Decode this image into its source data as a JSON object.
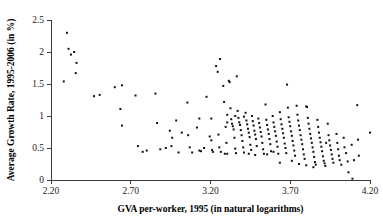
{
  "chart_data": {
    "type": "scatter",
    "title": "",
    "xlabel": "GVA per-worker, 1995 (in natural logarithms)",
    "ylabel": "Average Growth Rate, 1995-2006 (in %)",
    "xlim": [
      2.2,
      4.2
    ],
    "ylim": [
      0,
      2.5
    ],
    "xticks": [
      2.2,
      2.7,
      3.2,
      3.7,
      4.2
    ],
    "xtick_labels": [
      "2.20",
      "2.70",
      "3.20",
      "3.70",
      "4.20"
    ],
    "yticks": [
      0,
      0.5,
      1,
      1.5,
      2,
      2.5
    ],
    "ytick_labels": [
      "0",
      "0.5",
      "1",
      "1.5",
      "2",
      "2.5"
    ],
    "grid": false,
    "legend": null,
    "marker": "square",
    "marker_color": "#111111",
    "marker_size": 2,
    "series": [
      {
        "name": "regions",
        "points": [
          [
            2.3,
            2.3
          ],
          [
            2.28,
            1.54
          ],
          [
            2.31,
            2.05
          ],
          [
            2.325,
            1.96
          ],
          [
            2.345,
            2.0
          ],
          [
            2.36,
            1.83
          ],
          [
            2.355,
            1.67
          ],
          [
            2.47,
            1.31
          ],
          [
            2.505,
            1.33
          ],
          [
            2.6,
            1.45
          ],
          [
            2.645,
            1.48
          ],
          [
            2.635,
            1.11
          ],
          [
            2.645,
            0.85
          ],
          [
            2.73,
            1.32
          ],
          [
            2.745,
            0.53
          ],
          [
            2.775,
            0.44
          ],
          [
            2.8,
            0.46
          ],
          [
            2.855,
            1.35
          ],
          [
            2.865,
            0.89
          ],
          [
            2.885,
            0.48
          ],
          [
            2.945,
            0.77
          ],
          [
            2.955,
            0.53
          ],
          [
            2.96,
            0.66
          ],
          [
            2.985,
            0.93
          ],
          [
            3.0,
            0.43
          ],
          [
            3.02,
            0.74
          ],
          [
            3.055,
            1.21
          ],
          [
            3.06,
            0.7
          ],
          [
            3.085,
            0.43
          ],
          [
            3.115,
            0.82
          ],
          [
            3.13,
            0.46
          ],
          [
            3.14,
            0.45
          ],
          [
            3.175,
            1.3
          ],
          [
            3.195,
            0.68
          ],
          [
            3.205,
            0.62
          ],
          [
            3.21,
            0.47
          ],
          [
            3.215,
            0.44
          ],
          [
            3.235,
            1.78
          ],
          [
            3.245,
            1.69
          ],
          [
            3.26,
            1.89
          ],
          [
            3.25,
            0.71
          ],
          [
            3.255,
            0.51
          ],
          [
            3.265,
            0.44
          ],
          [
            3.28,
            1.47
          ],
          [
            3.285,
            1.22
          ],
          [
            3.295,
            0.83
          ],
          [
            3.3,
            0.58
          ],
          [
            3.305,
            0.41
          ],
          [
            3.315,
            1.55
          ],
          [
            3.32,
            1.53
          ],
          [
            3.325,
            1.12
          ],
          [
            3.33,
            0.95
          ],
          [
            3.335,
            0.88
          ],
          [
            3.34,
            0.84
          ],
          [
            3.345,
            0.79
          ],
          [
            3.35,
            0.66
          ],
          [
            3.355,
            0.49
          ],
          [
            3.36,
            0.42
          ],
          [
            3.365,
            1.62
          ],
          [
            3.37,
            1.08
          ],
          [
            3.375,
            0.97
          ],
          [
            3.38,
            0.9
          ],
          [
            3.385,
            0.86
          ],
          [
            3.39,
            0.78
          ],
          [
            3.395,
            0.7
          ],
          [
            3.4,
            0.61
          ],
          [
            3.405,
            0.51
          ],
          [
            3.41,
            0.43
          ],
          [
            3.42,
            1.05
          ],
          [
            3.425,
            0.93
          ],
          [
            3.43,
            0.87
          ],
          [
            3.435,
            0.8
          ],
          [
            3.44,
            0.74
          ],
          [
            3.445,
            0.67
          ],
          [
            3.45,
            0.55
          ],
          [
            3.455,
            0.47
          ],
          [
            3.46,
            1.0
          ],
          [
            3.465,
            0.92
          ],
          [
            3.47,
            0.85
          ],
          [
            3.475,
            0.77
          ],
          [
            3.48,
            0.71
          ],
          [
            3.485,
            0.64
          ],
          [
            3.49,
            0.53
          ],
          [
            3.5,
            0.96
          ],
          [
            3.505,
            0.89
          ],
          [
            3.51,
            0.82
          ],
          [
            3.515,
            0.75
          ],
          [
            3.52,
            0.68
          ],
          [
            3.525,
            0.58
          ],
          [
            3.53,
            0.48
          ],
          [
            3.535,
            0.41
          ],
          [
            3.545,
            1.18
          ],
          [
            3.55,
            0.94
          ],
          [
            3.555,
            0.86
          ],
          [
            3.56,
            0.79
          ],
          [
            3.565,
            0.72
          ],
          [
            3.57,
            0.64
          ],
          [
            3.575,
            0.56
          ],
          [
            3.58,
            0.45
          ],
          [
            3.59,
            1.0
          ],
          [
            3.595,
            0.9
          ],
          [
            3.6,
            0.83
          ],
          [
            3.605,
            0.76
          ],
          [
            3.61,
            0.69
          ],
          [
            3.615,
            0.6
          ],
          [
            3.62,
            0.52
          ],
          [
            3.625,
            0.41
          ],
          [
            3.635,
            1.06
          ],
          [
            3.64,
            0.95
          ],
          [
            3.645,
            0.87
          ],
          [
            3.65,
            0.8
          ],
          [
            3.655,
            0.73
          ],
          [
            3.66,
            0.66
          ],
          [
            3.665,
            0.57
          ],
          [
            3.67,
            0.5
          ],
          [
            3.675,
            0.42
          ],
          [
            3.68,
            1.49
          ],
          [
            3.685,
            1.13
          ],
          [
            3.69,
            0.98
          ],
          [
            3.695,
            0.91
          ],
          [
            3.7,
            0.84
          ],
          [
            3.705,
            0.76
          ],
          [
            3.71,
            0.69
          ],
          [
            3.715,
            0.61
          ],
          [
            3.72,
            0.54
          ],
          [
            3.725,
            0.46
          ],
          [
            3.73,
            0.38
          ],
          [
            3.74,
            1.16
          ],
          [
            3.745,
            1.02
          ],
          [
            3.75,
            0.93
          ],
          [
            3.755,
            0.85
          ],
          [
            3.76,
            0.78
          ],
          [
            3.765,
            0.7
          ],
          [
            3.77,
            0.63
          ],
          [
            3.775,
            0.56
          ],
          [
            3.78,
            0.48
          ],
          [
            3.785,
            0.4
          ],
          [
            3.79,
            0.33
          ],
          [
            3.8,
            1.15
          ],
          [
            3.805,
            1.14
          ],
          [
            3.81,
            0.97
          ],
          [
            3.815,
            0.88
          ],
          [
            3.82,
            0.8
          ],
          [
            3.825,
            0.72
          ],
          [
            3.83,
            0.65
          ],
          [
            3.835,
            0.58
          ],
          [
            3.84,
            0.51
          ],
          [
            3.845,
            0.44
          ],
          [
            3.85,
            0.36
          ],
          [
            3.855,
            0.28
          ],
          [
            3.86,
            0.24
          ],
          [
            3.87,
            0.94
          ],
          [
            3.875,
            0.83
          ],
          [
            3.88,
            0.74
          ],
          [
            3.885,
            0.66
          ],
          [
            3.89,
            0.59
          ],
          [
            3.895,
            0.52
          ],
          [
            3.9,
            0.45
          ],
          [
            3.905,
            0.37
          ],
          [
            3.91,
            0.3
          ],
          [
            3.915,
            0.26
          ],
          [
            3.92,
            0.22
          ],
          [
            3.935,
            0.88
          ],
          [
            3.94,
            0.7
          ],
          [
            3.945,
            0.62
          ],
          [
            3.95,
            0.54
          ],
          [
            3.955,
            0.47
          ],
          [
            3.96,
            0.4
          ],
          [
            3.965,
            0.33
          ],
          [
            3.97,
            0.27
          ],
          [
            3.99,
            0.72
          ],
          [
            3.995,
            0.58
          ],
          [
            4.0,
            0.48
          ],
          [
            4.005,
            0.38
          ],
          [
            4.01,
            0.31
          ],
          [
            4.02,
            0.24
          ],
          [
            4.035,
            0.66
          ],
          [
            4.04,
            0.51
          ],
          [
            4.05,
            0.42
          ],
          [
            4.06,
            0.29
          ],
          [
            4.065,
            0.12
          ],
          [
            4.085,
            0.55
          ],
          [
            4.09,
            0.02
          ],
          [
            4.1,
            0.31
          ],
          [
            4.12,
            1.17
          ],
          [
            4.125,
            0.63
          ],
          [
            4.13,
            0.38
          ],
          [
            4.2,
            0.74
          ],
          [
            3.29,
            0.41
          ],
          [
            3.44,
            0.41
          ],
          [
            3.205,
            0.96
          ],
          [
            3.13,
            0.96
          ],
          [
            2.92,
            0.5
          ],
          [
            3.07,
            0.51
          ],
          [
            3.16,
            0.5
          ],
          [
            3.635,
            0.27
          ],
          [
            3.71,
            0.3
          ],
          [
            3.755,
            0.25
          ],
          [
            3.8,
            0.23
          ],
          [
            3.845,
            0.2
          ],
          [
            3.555,
            0.4
          ],
          [
            3.48,
            0.39
          ],
          [
            3.595,
            0.44
          ],
          [
            3.925,
            0.58
          ],
          [
            3.305,
            0.9
          ],
          [
            3.355,
            1.0
          ],
          [
            3.41,
            0.99
          ],
          [
            3.305,
            1.02
          ]
        ]
      }
    ]
  }
}
